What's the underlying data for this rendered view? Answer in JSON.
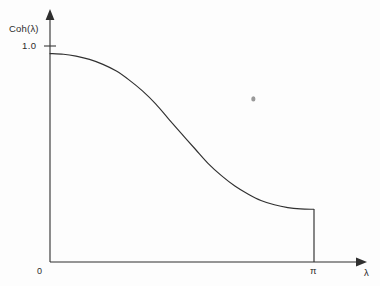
{
  "chart_data": {
    "type": "line",
    "title": "",
    "subtitle": "",
    "xlabel": "λ",
    "ylabel": "Coh(λ)",
    "x_tick_labels": [
      "0",
      "π"
    ],
    "x_tick_values": [
      0,
      3.14159
    ],
    "y_tick_labels": [
      "1.0"
    ],
    "y_tick_values": [
      1.0
    ],
    "xlim": [
      0,
      3.14159
    ],
    "ylim": [
      0,
      1.08
    ],
    "grid": false,
    "legend": null,
    "legend_position": "none",
    "axis_style": "arrow-ended open axes",
    "series": [
      {
        "name": "Coh(λ)",
        "color": "#303030",
        "x": [
          0.0,
          0.16,
          0.31,
          0.47,
          0.63,
          0.79,
          0.94,
          1.1,
          1.26,
          1.41,
          1.57,
          1.73,
          1.88,
          2.04,
          2.2,
          2.36,
          2.51,
          2.67,
          2.83,
          2.98,
          3.14
        ],
        "values": [
          0.965,
          0.962,
          0.953,
          0.938,
          0.915,
          0.884,
          0.843,
          0.792,
          0.731,
          0.663,
          0.592,
          0.522,
          0.457,
          0.4,
          0.352,
          0.314,
          0.285,
          0.265,
          0.252,
          0.246,
          0.244
        ]
      }
    ],
    "annotations": [
      {
        "name": "terminal-drop",
        "description": "vertical line from curve endpoint down to the x-axis at lambda = pi",
        "x": 3.14159,
        "y_from": 0.244,
        "y_to": 0.0
      },
      {
        "name": "scan-speck",
        "description": "small scanning artifact mark in the upper-right plot area",
        "x": 2.42,
        "y": 0.755
      }
    ]
  },
  "labels": {
    "y_axis": "Coh(λ)",
    "y_tick_1": "1.0",
    "origin": "0",
    "x_tick_pi": "π",
    "x_axis": "λ"
  },
  "colors": {
    "background": "#fdfdfd",
    "axis": "#2f2f2f",
    "curve": "#303030",
    "text": "#2b2b2b",
    "speck": "#9a9a9a"
  }
}
